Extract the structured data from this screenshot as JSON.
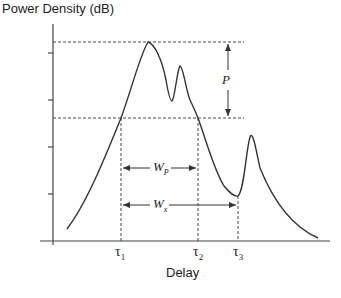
{
  "figure": {
    "y_axis_title": "Power Density  (dB)",
    "x_axis_title": "Delay",
    "markers": {
      "tau1": {
        "symbol": "τ",
        "sub": "1"
      },
      "tau2": {
        "symbol": "τ",
        "sub": "2"
      },
      "tau3": {
        "symbol": "τ",
        "sub": "3"
      }
    },
    "measurements": {
      "peak_drop": {
        "symbol": "P",
        "sub": ""
      },
      "width_p": {
        "symbol": "W",
        "sub": "P"
      },
      "width_x": {
        "symbol": "W",
        "sub": "x"
      }
    },
    "colors": {
      "line": "#333333",
      "background": "#ffffff"
    }
  }
}
